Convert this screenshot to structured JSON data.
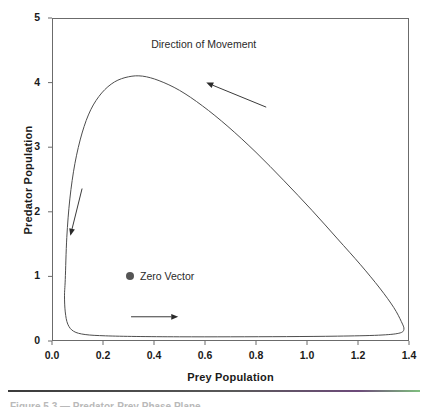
{
  "figure": {
    "background_color": "#ffffff",
    "axis_color": "#6b6b6b",
    "curve_color": "#4d4d4d",
    "zero_vector_color": "#555555",
    "caption_fragment": "Figure 5.3 — Predator-Prey Phase Plane"
  },
  "chart_data": {
    "type": "line",
    "title": "",
    "subtitle": "",
    "xlabel": "Prey Population",
    "ylabel": "Predator Population",
    "xlim": [
      0.0,
      1.4
    ],
    "ylim": [
      0,
      5
    ],
    "grid": false,
    "legend_position": "inside-center",
    "xticks": [
      "0.0",
      "0.2",
      "0.4",
      "0.6",
      "0.8",
      "1.0",
      "1.2",
      "1.4"
    ],
    "xtick_values": [
      0.0,
      0.2,
      0.4,
      0.6,
      0.8,
      1.0,
      1.2,
      1.4
    ],
    "yticks": [
      "0",
      "1",
      "2",
      "3",
      "4",
      "5"
    ],
    "ytick_values": [
      0,
      1,
      2,
      3,
      4,
      5
    ],
    "series": [
      {
        "name": "Limit cycle trajectory",
        "closed": true,
        "points": [
          [
            0.052,
            0.95
          ],
          [
            0.058,
            1.6
          ],
          [
            0.07,
            2.2
          ],
          [
            0.09,
            2.75
          ],
          [
            0.118,
            3.22
          ],
          [
            0.152,
            3.58
          ],
          [
            0.195,
            3.84
          ],
          [
            0.245,
            4.01
          ],
          [
            0.3,
            4.09
          ],
          [
            0.355,
            4.1
          ],
          [
            0.42,
            4.03
          ],
          [
            0.5,
            3.88
          ],
          [
            0.59,
            3.64
          ],
          [
            0.69,
            3.32
          ],
          [
            0.8,
            2.92
          ],
          [
            0.91,
            2.48
          ],
          [
            1.02,
            2.02
          ],
          [
            1.12,
            1.58
          ],
          [
            1.21,
            1.18
          ],
          [
            1.285,
            0.82
          ],
          [
            1.34,
            0.52
          ],
          [
            1.37,
            0.3
          ],
          [
            1.38,
            0.18
          ],
          [
            1.36,
            0.12
          ],
          [
            1.28,
            0.09
          ],
          [
            1.12,
            0.075
          ],
          [
            0.92,
            0.068
          ],
          [
            0.7,
            0.065
          ],
          [
            0.5,
            0.065
          ],
          [
            0.33,
            0.07
          ],
          [
            0.21,
            0.08
          ],
          [
            0.13,
            0.1
          ],
          [
            0.085,
            0.15
          ],
          [
            0.062,
            0.26
          ],
          [
            0.052,
            0.45
          ],
          [
            0.049,
            0.7
          ],
          [
            0.052,
            0.95
          ]
        ]
      }
    ],
    "annotations": [
      {
        "name": "direction-of-movement",
        "text": "Direction of Movement",
        "text_x": 0.595,
        "text_y": 4.6,
        "arrow": {
          "from_x": 0.84,
          "from_y": 3.62,
          "to_x": 0.605,
          "to_y": 4.0
        }
      },
      {
        "name": "zero-vector",
        "text": "Zero Vector",
        "marker": "filled-circle",
        "point_x": 0.31,
        "point_y": 0.99
      },
      {
        "name": "down-arrow",
        "text": "",
        "arrow": {
          "from_x": 0.118,
          "from_y": 2.36,
          "to_x": 0.072,
          "to_y": 1.63
        }
      },
      {
        "name": "right-arrow",
        "text": "",
        "arrow": {
          "from_x": 0.31,
          "from_y": 0.375,
          "to_x": 0.495,
          "to_y": 0.375
        }
      }
    ]
  }
}
